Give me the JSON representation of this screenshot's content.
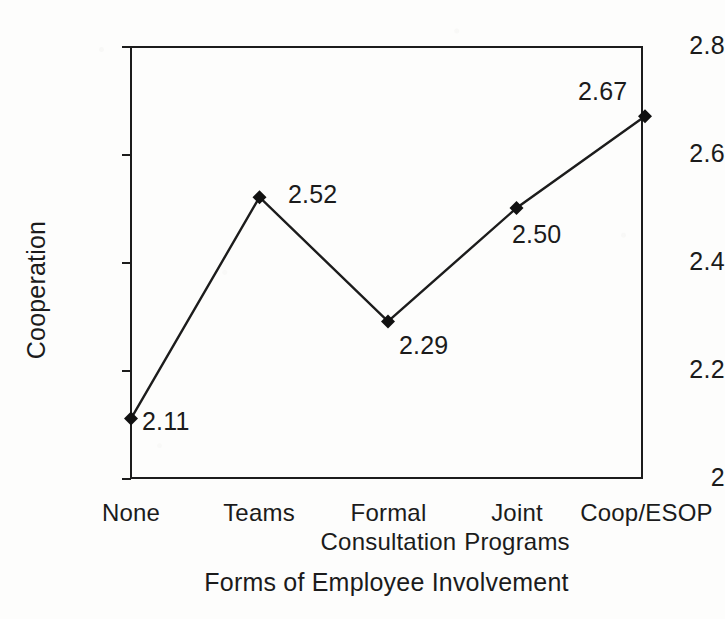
{
  "chart_data": {
    "type": "line",
    "title": "",
    "xlabel": "Forms of Employee Involvement",
    "ylabel": "Cooperation",
    "categories": [
      "None",
      "Teams",
      "Formal\nConsultation",
      "Joint\nPrograms",
      "Coop/ESOP"
    ],
    "values": [
      2.11,
      2.52,
      2.29,
      2.5,
      2.67
    ],
    "point_labels": [
      "2.11",
      "2.52",
      "2.29",
      "2.50",
      "2.67"
    ],
    "ylim": [
      2,
      2.8
    ],
    "ytick_labels": [
      "2.8",
      "2.6",
      "2.4",
      "2.2",
      "2"
    ],
    "ytick_values": [
      2.8,
      2.6,
      2.4,
      2.2,
      2
    ],
    "xtick_marks": false,
    "grid": false,
    "legend": null,
    "marker": "diamond",
    "line_color": "#1c1c1c",
    "marker_color": "#111111",
    "axis_color": "#1c1c1c",
    "background_color": "#fdfdfc"
  },
  "axis": {
    "y_title": "Cooperation",
    "x_title": "Forms of Employee Involvement"
  },
  "ticks": {
    "y": [
      {
        "label": "2.8",
        "value": 2.8
      },
      {
        "label": "2.6",
        "value": 2.6
      },
      {
        "label": "2.4",
        "value": 2.4
      },
      {
        "label": "2.2",
        "value": 2.2
      },
      {
        "label": "2",
        "value": 2
      }
    ]
  },
  "points": [
    {
      "category": "None",
      "label": "2.11",
      "value": 2.11
    },
    {
      "category": "Teams",
      "label": "2.52",
      "value": 2.52
    },
    {
      "category": "Formal\nConsultation",
      "label": "2.29",
      "value": 2.29
    },
    {
      "category": "Joint\nPrograms",
      "label": "2.50",
      "value": 2.5
    },
    {
      "category": "Coop/ESOP",
      "label": "2.67",
      "value": 2.67
    }
  ]
}
